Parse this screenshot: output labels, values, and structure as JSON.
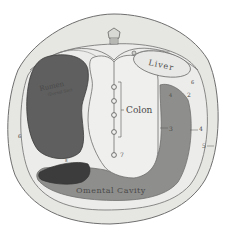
{
  "diagram": {
    "type": "anatomical cross-section",
    "labels": {
      "rumen": "Rumen",
      "rumen_sub": "(Dorsal Sac)",
      "liver": "Liver",
      "colon": "Colon",
      "omental_cavity": "Omental Cavity"
    },
    "numbers": {
      "n2": "2",
      "n3": "3",
      "n4a": "4",
      "n4b": "4",
      "n5": "5",
      "n6a": "6",
      "n6b": "6",
      "n7": "7",
      "n8": "8"
    },
    "colors": {
      "background": "#ffffff",
      "body_wall": "#e6e6e2",
      "cavity": "#ececea",
      "outline": "#6f6f6f",
      "rumen": "#5f5f5f",
      "rumen_dark": "#3c3c3c",
      "omental": "#8e8e8c",
      "colon": "#efefed",
      "liver": "#e8e8e6"
    }
  }
}
